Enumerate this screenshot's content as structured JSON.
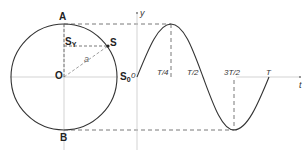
{
  "diagram": {
    "title": "",
    "type": "circle-projection-to-sine-wave",
    "circle": {
      "center_label": "O",
      "top_label": "A",
      "bottom_label": "B",
      "point_label": "S",
      "start_point_label": "S",
      "start_point_sub": "0",
      "projection_label": "S",
      "projection_sub": "Y",
      "radius_label": "a"
    },
    "graph": {
      "y_axis_label": "y",
      "t_axis_label": "t",
      "origin_label": "0",
      "ticks": [
        "T/4",
        "T/2",
        "3T/2",
        "T"
      ]
    },
    "colors": {
      "curve": "#333333",
      "dashed": "#555555",
      "axis": "#bbbbbb",
      "text": "#333333"
    }
  }
}
